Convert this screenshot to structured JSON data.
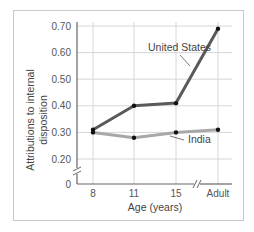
{
  "chart_data": {
    "type": "line",
    "title": "",
    "xlabel": "Age (years)",
    "ylabel": "Attributions to internal disposition",
    "ylabel_lines": [
      "Attributions to internal",
      "disposition"
    ],
    "categories": [
      "8",
      "11",
      "15",
      "Adult"
    ],
    "yticks": [
      "0",
      "0.20",
      "0.30",
      "0.40",
      "0.50",
      "0.60",
      "0.70"
    ],
    "ylim": [
      0,
      0.7
    ],
    "axis_break_y": true,
    "axis_break_x_between": [
      "15",
      "Adult"
    ],
    "grid": true,
    "legend": "inline labels",
    "series": [
      {
        "name": "United States",
        "values": [
          0.31,
          0.4,
          0.41,
          0.69
        ],
        "color": "#5a5a5a"
      },
      {
        "name": "India",
        "values": [
          0.3,
          0.28,
          0.3,
          0.31
        ],
        "color": "#a8a8a8"
      }
    ]
  },
  "colors": {
    "grid": "#d6d6d6",
    "axis": "#666666",
    "frame": "#c9c9c9",
    "marker": "#111111"
  }
}
